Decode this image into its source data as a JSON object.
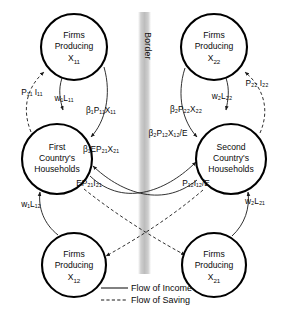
{
  "figure": {
    "type": "circular-flow-diagram",
    "border_label": "Border"
  },
  "nodes": [
    {
      "id": "firms-x11",
      "line1": "Firms",
      "line2": "Producing",
      "line3": "X",
      "sub3": "11",
      "cx": 74,
      "cy": 47,
      "r": 33
    },
    {
      "id": "firms-x22",
      "line1": "Firms",
      "line2": "Producing",
      "line3": "X",
      "sub3": "22",
      "cx": 214,
      "cy": 47,
      "r": 33
    },
    {
      "id": "households-1",
      "line1": "First",
      "line2": "Country's",
      "line3": "Households",
      "cx": 57,
      "cy": 159,
      "r": 35
    },
    {
      "id": "households-2",
      "line1": "Second",
      "line2": "Country's",
      "line3": "Households",
      "cx": 231,
      "cy": 159,
      "r": 35
    },
    {
      "id": "firms-x12",
      "line1": "Firms",
      "line2": "Producing",
      "line3": "X",
      "sub3": "12",
      "cx": 74,
      "cy": 265,
      "r": 32
    },
    {
      "id": "firms-x21",
      "line1": "Firms",
      "line2": "Producing",
      "line3": "X",
      "sub3": "21",
      "cx": 214,
      "cy": 265,
      "r": 32
    }
  ],
  "edge_labels": [
    {
      "id": "p11-i11",
      "text": "P₁₁ I₁₁",
      "flow": "saving",
      "x": 32,
      "y": 95
    },
    {
      "id": "w1-l11",
      "text": "w₁L₁₁",
      "flow": "income",
      "x": 64,
      "y": 101
    },
    {
      "id": "beta1-p11-x11",
      "text": "β₁P₁₁X₁₁",
      "flow": "income",
      "x": 101,
      "y": 113
    },
    {
      "id": "p22-i22",
      "text": "P₂₂ I₂₂",
      "flow": "saving",
      "x": 257,
      "y": 86
    },
    {
      "id": "w2-l22",
      "text": "w₂L₂₂",
      "flow": "income",
      "x": 222,
      "y": 99
    },
    {
      "id": "beta2-p22-x22",
      "text": "β₂P₂₂X₂₂",
      "flow": "income",
      "x": 186,
      "y": 112
    },
    {
      "id": "beta1-ep21-x21",
      "text": "β₁EP₂₁X₂₁",
      "flow": "income",
      "x": 101,
      "y": 152
    },
    {
      "id": "beta2-p12-x12",
      "text": "β₂P₁₂X₁₂/E",
      "flow": "income",
      "x": 168,
      "y": 136
    },
    {
      "id": "ep21-i21",
      "text": "EP₂₁I₂₁",
      "flow": "saving",
      "x": 89,
      "y": 186
    },
    {
      "id": "p12-i12",
      "text": "P₁₂I₁₂/E",
      "flow": "saving",
      "x": 196,
      "y": 186
    },
    {
      "id": "w1-l12",
      "text": "w₁L₁₂",
      "flow": "income",
      "x": 31,
      "y": 207
    },
    {
      "id": "w2-l21",
      "text": "w₂L₂₁",
      "flow": "income",
      "x": 255,
      "y": 204
    }
  ],
  "legend": {
    "items": [
      {
        "id": "legend-income",
        "label": "Flow of Income",
        "style": "solid"
      },
      {
        "id": "legend-saving",
        "label": "Flow of Saving",
        "style": "dashed"
      }
    ]
  },
  "colors": {
    "ink": "#0a0a0a",
    "stroke": "#1a1a1a",
    "border_band": "#c9c9c9",
    "background": "#ffffff"
  }
}
